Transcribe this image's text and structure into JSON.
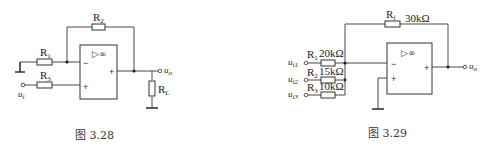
{
  "figures": [
    {
      "caption": "图 3.28",
      "opamp_symbol": "▷∞",
      "minus_sign": "−",
      "plus_sign": "+",
      "output_sign": "+",
      "components": {
        "R1": {
          "letter": "R",
          "sub": "1"
        },
        "R2": {
          "letter": "R",
          "sub": "2"
        },
        "R3": {
          "letter": "R",
          "sub": "3"
        },
        "RL": {
          "letter": "R",
          "sub": "L"
        }
      },
      "terminals": {
        "input": {
          "letter": "u",
          "sub": "i"
        },
        "output": {
          "letter": "u",
          "sub": "o"
        }
      }
    },
    {
      "caption": "图 3.29",
      "opamp_symbol": "▷∞",
      "minus_sign": "−",
      "plus_sign": "+",
      "output_sign": "+",
      "components": {
        "Rf": {
          "letter": "R",
          "sub": "f",
          "value": "30kΩ"
        },
        "R1": {
          "letter": "R",
          "sub": "1",
          "value": "20kΩ"
        },
        "R2": {
          "letter": "R",
          "sub": "2",
          "value": "15kΩ"
        },
        "R3": {
          "letter": "R",
          "sub": "3",
          "value": "10kΩ"
        }
      },
      "terminals": {
        "ui1": {
          "letter": "u",
          "sub": "i1"
        },
        "ui2": {
          "letter": "u",
          "sub": "i2"
        },
        "ui3": {
          "letter": "u",
          "sub": "i3"
        },
        "output": {
          "letter": "u",
          "sub": "o"
        }
      }
    }
  ]
}
